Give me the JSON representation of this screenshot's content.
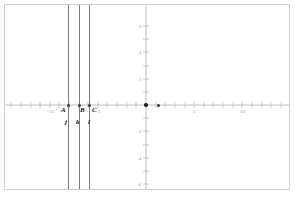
{
  "figure": {
    "caption": "",
    "background": "#ffffff",
    "frame_color": "#cfcfcf",
    "axis_color": "#b0b0b0",
    "line_color": "#8f8f8f",
    "point_color": "#333333"
  },
  "axes": {
    "x": {
      "label": "x",
      "origin_px": 146,
      "unit_px": 9.6,
      "tick_labels": [
        {
          "value": "-10",
          "x": 50
        },
        {
          "value": "-5",
          "x": 98
        },
        {
          "value": "5",
          "x": 194
        },
        {
          "value": "10",
          "x": 242
        }
      ],
      "ticks": [
        -14,
        -13,
        -12,
        -11,
        -10,
        -9,
        -8,
        -7,
        -6,
        -5,
        -4,
        -3,
        -2,
        -1,
        1,
        2,
        3,
        4,
        5,
        6,
        7,
        8,
        9,
        10,
        11,
        12,
        13,
        14
      ]
    },
    "y": {
      "label": "y",
      "origin_px": 105,
      "unit_px": 13.2,
      "tick_labels": [
        {
          "value": "6",
          "y": 26
        },
        {
          "value": "4",
          "y": 52
        },
        {
          "value": "2",
          "y": 79
        },
        {
          "value": "-2",
          "y": 131
        },
        {
          "value": "-4",
          "y": 158
        },
        {
          "value": "-6",
          "y": 184
        }
      ],
      "ticks": [
        -6,
        -5,
        -4,
        -3,
        -2,
        -1,
        1,
        2,
        3,
        4,
        5,
        6
      ]
    }
  },
  "lines": [
    {
      "name": "j",
      "label": "j",
      "x_px": 68,
      "label_x": 66,
      "label_y": 122
    },
    {
      "name": "k",
      "label": "k",
      "x_px": 79,
      "label_x": 77,
      "label_y": 122
    },
    {
      "name": "l",
      "label": "l",
      "x_px": 89,
      "label_x": 88,
      "label_y": 122
    }
  ],
  "points": [
    {
      "name": "A",
      "label": "A",
      "x_px": 68,
      "y_px": 105,
      "label_x": 62,
      "label_y": 109
    },
    {
      "name": "B",
      "label": "B",
      "x_px": 79,
      "y_px": 105,
      "label_x": 79,
      "label_y": 109
    },
    {
      "name": "C",
      "label": "C",
      "x_px": 89,
      "y_px": 105,
      "label_x": 92,
      "label_y": 109
    },
    {
      "name": "origin-point",
      "label": "",
      "x_px": 146,
      "y_px": 105,
      "label_x": 0,
      "label_y": 0
    },
    {
      "name": "point-right",
      "label": "",
      "x_px": 158,
      "y_px": 105,
      "label_x": 0,
      "label_y": 0
    }
  ]
}
